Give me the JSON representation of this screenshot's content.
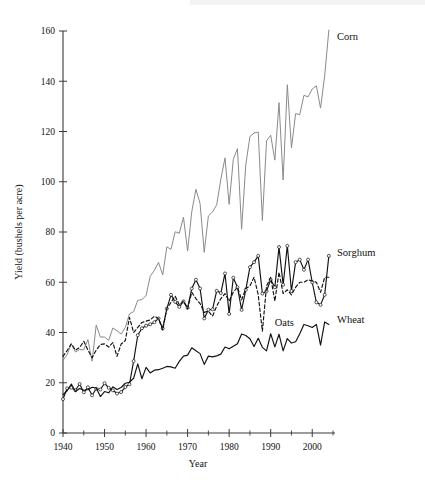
{
  "chart_data": {
    "type": "line",
    "title": "",
    "xlabel": "Year",
    "ylabel": "Yield (bushels per acre)",
    "xlim": [
      1940,
      2005
    ],
    "ylim": [
      0,
      160
    ],
    "grid": false,
    "legend_position": "right-inline-labels",
    "x_ticks_major": [
      1940,
      1950,
      1960,
      1970,
      1980,
      1990,
      2000
    ],
    "x_ticks_minor": [
      1945,
      1955,
      1965,
      1975,
      1985,
      1995,
      2005
    ],
    "y_ticks_major": [
      0,
      20,
      40,
      60,
      80,
      100,
      120,
      140,
      160
    ],
    "x": [
      1940,
      1941,
      1942,
      1943,
      1944,
      1945,
      1946,
      1947,
      1948,
      1949,
      1950,
      1951,
      1952,
      1953,
      1954,
      1955,
      1956,
      1957,
      1958,
      1959,
      1960,
      1961,
      1962,
      1963,
      1964,
      1965,
      1966,
      1967,
      1968,
      1969,
      1970,
      1971,
      1972,
      1973,
      1974,
      1975,
      1976,
      1977,
      1978,
      1979,
      1980,
      1981,
      1982,
      1983,
      1984,
      1985,
      1986,
      1987,
      1988,
      1989,
      1990,
      1991,
      1992,
      1993,
      1994,
      1995,
      1996,
      1997,
      1998,
      1999,
      2000,
      2001,
      2002,
      2003,
      2004
    ],
    "series": [
      {
        "name": "Corn",
        "color": "#8a8a8a",
        "style": "solid",
        "markers": false,
        "label_x": 2005,
        "label_y": 158,
        "values": [
          28.9,
          31.2,
          35.4,
          32.2,
          33.2,
          33.1,
          37.2,
          28.6,
          43.0,
          38.2,
          38.2,
          36.9,
          41.8,
          40.7,
          39.4,
          42.0,
          47.4,
          48.3,
          52.8,
          53.1,
          54.7,
          62.4,
          64.7,
          67.9,
          62.9,
          74.1,
          73.1,
          80.1,
          79.5,
          85.9,
          72.4,
          88.1,
          97.0,
          91.3,
          71.9,
          86.4,
          88.0,
          90.8,
          101.0,
          109.5,
          91.0,
          108.9,
          113.2,
          81.1,
          106.7,
          118.0,
          119.4,
          119.8,
          84.6,
          116.3,
          118.5,
          108.6,
          131.5,
          100.7,
          138.6,
          113.5,
          127.1,
          126.7,
          134.4,
          133.8,
          136.9,
          138.2,
          129.3,
          142.2,
          160.4
        ]
      },
      {
        "name": "Sorghum",
        "color": "#111111",
        "style": "solid",
        "markers": true,
        "label_x": 2005,
        "label_y": 72,
        "values": [
          13.5,
          17.8,
          18.0,
          17.0,
          19.5,
          16.2,
          18.2,
          15.0,
          17.6,
          17.3,
          19.8,
          18.0,
          17.0,
          15.7,
          16.3,
          18.3,
          19.4,
          28.6,
          38.9,
          41.7,
          42.7,
          43.3,
          44.1,
          45.6,
          41.6,
          49.5,
          55.0,
          52.2,
          50.2,
          52.4,
          49.8,
          57.5,
          61.0,
          57.5,
          45.6,
          49.1,
          49.2,
          56.6,
          55.7,
          63.5,
          47.4,
          61.8,
          58.0,
          49.0,
          57.0,
          66.0,
          68.0,
          70.5,
          55.5,
          56.5,
          61.0,
          58.0,
          74.0,
          59.0,
          74.5,
          56.5,
          68.0,
          69.0,
          65.0,
          69.0,
          60.0,
          52.0,
          51.0,
          55.0,
          70.5
        ]
      },
      {
        "name": "Oats",
        "color": "#111111",
        "style": "dashed",
        "markers": false,
        "label_x": 1990,
        "label_y": 44,
        "values": [
          30.5,
          32.8,
          35.5,
          33.0,
          34.0,
          36.5,
          33.0,
          30.0,
          33.0,
          35.2,
          35.5,
          34.2,
          36.0,
          30.5,
          35.4,
          36.8,
          46.0,
          40.0,
          42.0,
          44.0,
          44.5,
          45.0,
          46.5,
          45.5,
          41.0,
          49.5,
          52.0,
          54.5,
          51.0,
          52.5,
          49.5,
          56.0,
          53.5,
          51.5,
          48.0,
          48.5,
          46.5,
          50.5,
          53.5,
          55.5,
          52.5,
          56.0,
          58.0,
          53.0,
          57.5,
          58.5,
          62.0,
          55.0,
          40.5,
          58.5,
          62.0,
          52.5,
          64.0,
          55.5,
          57.0,
          55.0,
          58.0,
          60.0,
          60.0,
          61.0,
          60.5,
          60.0,
          56.0,
          62.0,
          62.0
        ]
      },
      {
        "name": "Wheat",
        "color": "#111111",
        "style": "solid",
        "markers": false,
        "label_x": 2005,
        "label_y": 45,
        "values": [
          15.3,
          16.8,
          19.5,
          16.5,
          17.7,
          17.0,
          17.2,
          18.2,
          17.9,
          14.5,
          16.5,
          16.0,
          18.4,
          17.3,
          18.1,
          19.8,
          20.2,
          21.8,
          27.5,
          21.6,
          26.1,
          23.9,
          25.0,
          25.2,
          25.8,
          26.5,
          26.3,
          25.8,
          28.5,
          30.6,
          31.0,
          33.9,
          32.7,
          31.6,
          27.3,
          30.6,
          30.3,
          30.7,
          31.4,
          34.2,
          33.5,
          34.5,
          35.5,
          39.4,
          38.8,
          37.5,
          34.4,
          37.7,
          34.1,
          32.7,
          39.5,
          34.3,
          39.3,
          32.7,
          37.6,
          35.8,
          36.3,
          39.5,
          43.2,
          42.7,
          42.0,
          43.2,
          35.0,
          44.2,
          43.2
        ]
      }
    ]
  },
  "axis": {
    "x_tick_labels": [
      "1940",
      "1950",
      "1960",
      "1970",
      "1980",
      "1990",
      "2000"
    ],
    "y_tick_labels": [
      "0",
      "20",
      "40",
      "60",
      "80",
      "100",
      "120",
      "140",
      "160"
    ],
    "x_title": "Year",
    "y_title": "Yield (bushels per acre)"
  },
  "series_labels": {
    "corn": "Corn",
    "sorghum": "Sorghum",
    "oats": "Oats",
    "wheat": "Wheat"
  }
}
